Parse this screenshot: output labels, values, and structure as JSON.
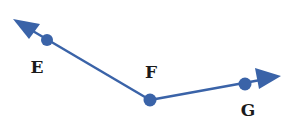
{
  "diagram": {
    "type": "angle",
    "color": "#3a63a8",
    "points": [
      {
        "id": "E",
        "label": "E",
        "x": 47,
        "y": 40,
        "label_x": 37,
        "label_y": 67
      },
      {
        "id": "F",
        "label": "F",
        "x": 150,
        "y": 100,
        "label_x": 151,
        "label_y": 72
      },
      {
        "id": "G",
        "label": "G",
        "x": 245,
        "y": 84,
        "label_x": 248,
        "label_y": 110
      }
    ],
    "rays": [
      {
        "from": "F",
        "through": "E",
        "tip_x": 14,
        "tip_y": 20
      },
      {
        "from": "F",
        "through": "G",
        "tip_x": 280,
        "tip_y": 76
      }
    ]
  }
}
